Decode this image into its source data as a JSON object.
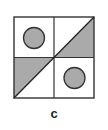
{
  "figure": {
    "label": "c",
    "grid": {
      "rows": 2,
      "cols": 2,
      "stroke_color": "#333333",
      "fill_color": "#aaaaaa",
      "background": "#ffffff"
    },
    "cells": [
      {
        "position": "top-left",
        "shape": "circle",
        "filled": true
      },
      {
        "position": "top-right",
        "shape": "triangle",
        "orientation": "lower-right half",
        "filled": true
      },
      {
        "position": "bottom-left",
        "shape": "triangle",
        "orientation": "upper-left half",
        "filled": true
      },
      {
        "position": "bottom-right",
        "shape": "circle",
        "filled": true
      }
    ],
    "diagonal": "bottom-left to top-right across full square"
  }
}
